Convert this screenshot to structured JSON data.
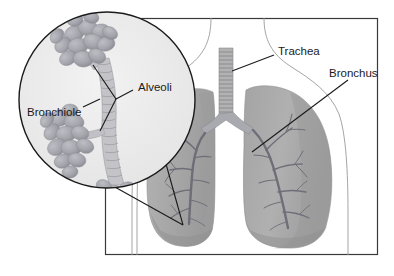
{
  "figure": {
    "canvas": {
      "width": 394,
      "height": 276
    },
    "background_color": "#ffffff"
  },
  "frame": {
    "name": "diagram-border",
    "x": 105,
    "y": 18,
    "width": 273,
    "height": 237,
    "stroke_color": "#3a3a3a"
  },
  "labels": {
    "trachea": "Trachea",
    "bronchus": "Bronchus",
    "alveoli": "Alveoli",
    "bronchiole": "Bronchiole"
  },
  "label_positions": {
    "trachea": {
      "x": 278,
      "y": 52
    },
    "bronchus": {
      "x": 329,
      "y": 74
    },
    "alveoli": {
      "x": 138,
      "y": 88
    },
    "bronchiole": {
      "x": 27,
      "y": 113
    }
  },
  "colors": {
    "lung_fill": "#a8a8a8",
    "lung_shade": "#9a9a9a",
    "lung_highlight": "#b8b8b8",
    "bronchial_tree": "#6e6e78",
    "trachea_fill": "#b0b0b0",
    "trachea_ring": "#8a8a92",
    "lens_fill": "#ebebeb",
    "alveoli_fill": "#a6a6ae",
    "alveoli_shade": "#94949c",
    "outline": "#1a1a1a",
    "body_outline": "#9a9a9a"
  },
  "magnifier": {
    "name": "alveoli-magnifier",
    "center_x": 107,
    "center_y": 100,
    "radius": 89,
    "focus_point": {
      "x": 183,
      "y": 225
    },
    "description": "Magnified view of alveolar sacs attached to a bronchiole"
  },
  "anatomy": {
    "trachea": {
      "x": 218,
      "y_top": 48,
      "y_bottom": 125,
      "width": 14,
      "cartilage_ring_count": 16
    },
    "left_lung": {
      "x": 148,
      "y": 86,
      "width": 68,
      "height": 162
    },
    "right_lung": {
      "x": 243,
      "y": 84,
      "width": 88,
      "height": 164
    }
  }
}
